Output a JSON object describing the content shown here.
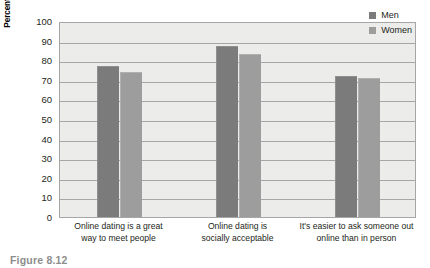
{
  "figure": {
    "caption": "Figure  8.12"
  },
  "chart_data": {
    "type": "bar",
    "title": "",
    "xlabel": "",
    "ylabel": "Percent agreeing with each statement",
    "ylim": [
      0,
      100
    ],
    "ytick_step": 10,
    "yticks": [
      100,
      90,
      80,
      70,
      60,
      50,
      40,
      30,
      20,
      10,
      0
    ],
    "ytick_labels": [
      "100",
      "90",
      "80",
      "70",
      "60",
      "50",
      "40",
      "30",
      "20",
      "10",
      "0"
    ],
    "grid": true,
    "grid_axis": "y",
    "legend_position": "top-right",
    "categories": [
      "Online dating is a great way to meet people",
      "Online dating is socially acceptable",
      "It's easier to ask someone out online than in person"
    ],
    "category_lines": [
      [
        "Online dating is a great",
        "way to meet people"
      ],
      [
        "Online dating is",
        "socially acceptable"
      ],
      [
        "It's easier to ask someone out",
        "online than in person"
      ]
    ],
    "series": [
      {
        "name": "Men",
        "color": "#7b7b7b",
        "values": [
          77,
          87,
          72
        ]
      },
      {
        "name": "Women",
        "color": "#9d9d9d",
        "values": [
          74,
          83,
          71
        ]
      }
    ]
  },
  "colors": {
    "men": "#7b7b7b",
    "women": "#9d9d9d",
    "plot_background": "#ececeb",
    "gridline": "#a6a6a6",
    "axis_text": "#231f20",
    "caption": "#8d8d8d"
  }
}
